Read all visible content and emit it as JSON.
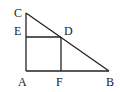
{
  "diagram": {
    "type": "geometry",
    "points": {
      "A": {
        "label": "A",
        "x": 26,
        "y": 71
      },
      "B": {
        "label": "B",
        "x": 109,
        "y": 71
      },
      "C": {
        "label": "C",
        "x": 26,
        "y": 13
      },
      "D": {
        "label": "D",
        "x": 61,
        "y": 37
      },
      "E": {
        "label": "E",
        "x": 26,
        "y": 37
      },
      "F": {
        "label": "F",
        "x": 61,
        "y": 71
      }
    },
    "segments": [
      [
        "C",
        "A"
      ],
      [
        "A",
        "B"
      ],
      [
        "B",
        "C"
      ],
      [
        "E",
        "D"
      ],
      [
        "D",
        "F"
      ]
    ],
    "stroke_color": "#222222"
  }
}
